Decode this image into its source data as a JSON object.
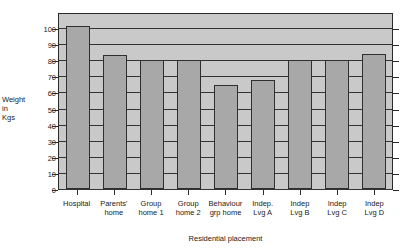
{
  "chart_data": {
    "type": "bar",
    "title": "",
    "xlabel": "Residential placement",
    "ylabel": "Weight in Kgs",
    "ylabel_lines": [
      "Weight",
      "in",
      "Kgs"
    ],
    "categories": [
      "Hospital",
      "Parents' home",
      "Group home 1",
      "Group home 2",
      "Behaviour grp home",
      "Indep. Lvg A",
      "Indep Lvg B",
      "Indep Lvg C",
      "Indep Lvg D"
    ],
    "category_lines": [
      [
        "Hospital"
      ],
      [
        "Parents'",
        "home"
      ],
      [
        "Group",
        "home 1"
      ],
      [
        "Group",
        "home 2"
      ],
      [
        "Behaviour",
        "grp home"
      ],
      [
        "Indep.",
        "Lvg A"
      ],
      [
        "Indep",
        "Lvg B"
      ],
      [
        "Indep",
        "Lvg C"
      ],
      [
        "Indep",
        "Lvg D"
      ]
    ],
    "values": [
      101,
      83.5,
      80,
      80,
      64.5,
      68,
      80,
      80,
      84
    ],
    "ylim": [
      0,
      110
    ],
    "yticks": [
      0,
      10,
      20,
      30,
      40,
      50,
      60,
      70,
      80,
      90,
      100
    ],
    "ytick_labels": [
      "0",
      "10",
      "20",
      "30",
      "40",
      "50",
      "60",
      "70",
      "80",
      "90",
      "100"
    ],
    "grid": true,
    "grid_axis": "y",
    "legend": false,
    "colors": {
      "bar_fill": "#a8a8a8",
      "bar_edge": "#2f2f2f",
      "plot_background": "#c9c9c9",
      "grid_line": "#333333",
      "axis_line": "#2a2a2a",
      "text": "#1a1a1a",
      "page_background": "#ffffff"
    }
  }
}
